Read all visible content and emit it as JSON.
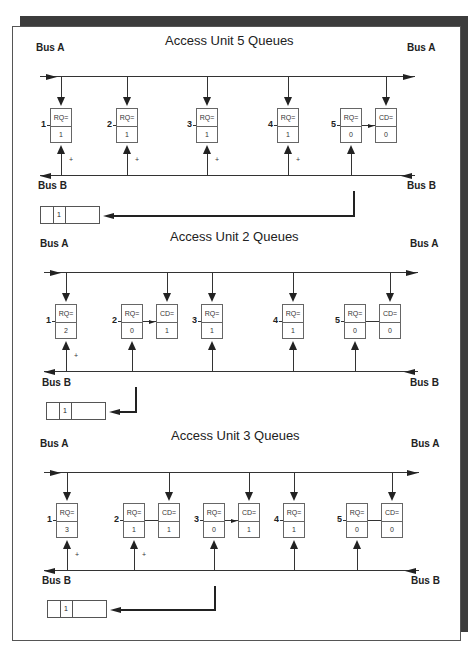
{
  "sections": [
    {
      "title": "Access Unit 5 Queues",
      "bus_a_label": "Bus A",
      "bus_b_label": "Bus B",
      "layout": {
        "title_x": 165,
        "title_y": 47,
        "bus_a_label_y": 52,
        "bus_a_y": 76,
        "box_y": 108,
        "bus_b_y": 175,
        "bus_b_label_y": 186,
        "queue_y": 206,
        "queue_x": 40,
        "bus_line_x1": 40,
        "bus_line_x2": 415
      },
      "units": [
        {
          "num": "1",
          "x": 50,
          "cells": [
            {
              "label": "RQ=",
              "value": "1",
              "bus_a_drop": true,
              "bus_b_rise": true,
              "plus": true
            }
          ]
        },
        {
          "num": "2",
          "x": 116,
          "cells": [
            {
              "label": "RQ=",
              "value": "1",
              "bus_a_drop": true,
              "bus_b_rise": true,
              "plus": true
            }
          ]
        },
        {
          "num": "3",
          "x": 196,
          "cells": [
            {
              "label": "RQ=",
              "value": "1",
              "bus_a_drop": true,
              "bus_b_rise": true,
              "plus": true
            }
          ]
        },
        {
          "num": "4",
          "x": 277,
          "cells": [
            {
              "label": "RQ=",
              "value": "1",
              "bus_a_drop": true,
              "bus_b_rise": true,
              "plus": true
            }
          ]
        },
        {
          "num": "5",
          "x": 340,
          "cells": [
            {
              "label": "RQ=",
              "value": "0",
              "bus_a_drop": false,
              "bus_b_rise": true,
              "plus": false
            },
            {
              "label": "CD=",
              "value": "0",
              "bus_a_drop": true,
              "bus_b_rise": false,
              "plus": false
            }
          ],
          "connector": "arrow"
        }
      ],
      "queue": {
        "value": "1"
      },
      "return_path": {
        "from_x": 353,
        "top_y": 191
      }
    },
    {
      "title": "Access Unit 2 Queues",
      "bus_a_label": "Bus A",
      "bus_b_label": "Bus B",
      "layout": {
        "title_x": 170,
        "title_y": 243,
        "bus_a_label_y": 248,
        "bus_a_y": 272,
        "box_y": 304,
        "bus_b_y": 371,
        "bus_b_label_y": 383,
        "queue_y": 402,
        "queue_x": 46,
        "bus_line_x1": 44,
        "bus_line_x2": 418
      },
      "units": [
        {
          "num": "1",
          "x": 55,
          "cells": [
            {
              "label": "RQ=",
              "value": "2",
              "bus_a_drop": true,
              "bus_b_rise": true,
              "plus": true
            }
          ]
        },
        {
          "num": "2",
          "x": 121,
          "cells": [
            {
              "label": "RQ=",
              "value": "0",
              "bus_a_drop": false,
              "bus_b_rise": true,
              "plus": false
            },
            {
              "label": "CD=",
              "value": "1",
              "bus_a_drop": true,
              "bus_b_rise": false,
              "plus": false
            }
          ],
          "connector": "arrow"
        },
        {
          "num": "3",
          "x": 201,
          "cells": [
            {
              "label": "RQ=",
              "value": "1",
              "bus_a_drop": true,
              "bus_b_rise": true,
              "plus": false
            }
          ]
        },
        {
          "num": "4",
          "x": 282,
          "cells": [
            {
              "label": "RQ=",
              "value": "1",
              "bus_a_drop": true,
              "bus_b_rise": true,
              "plus": false
            }
          ]
        },
        {
          "num": "5",
          "x": 344,
          "cells": [
            {
              "label": "RQ=",
              "value": "0",
              "bus_a_drop": false,
              "bus_b_rise": true,
              "plus": false
            },
            {
              "label": "CD=",
              "value": "0",
              "bus_a_drop": true,
              "bus_b_rise": false,
              "plus": false
            }
          ],
          "connector": "line"
        }
      ],
      "queue": {
        "value": "1"
      },
      "return_path": {
        "from_x": 135,
        "top_y": 387
      }
    },
    {
      "title": "Access Unit 3 Queues",
      "bus_a_label": "Bus A",
      "bus_b_label": "Bus B",
      "layout": {
        "title_x": 171,
        "title_y": 442,
        "bus_a_label_y": 448,
        "bus_a_y": 472,
        "box_y": 503,
        "bus_b_y": 570,
        "bus_b_label_y": 581,
        "queue_y": 600,
        "queue_x": 47,
        "bus_line_x1": 44,
        "bus_line_x2": 419
      },
      "units": [
        {
          "num": "1",
          "x": 56,
          "cells": [
            {
              "label": "RQ=",
              "value": "3",
              "bus_a_drop": true,
              "bus_b_rise": true,
              "plus": true
            }
          ]
        },
        {
          "num": "2",
          "x": 123,
          "cells": [
            {
              "label": "RQ=",
              "value": "1",
              "bus_a_drop": false,
              "bus_b_rise": true,
              "plus": true
            },
            {
              "label": "CD=",
              "value": "1",
              "bus_a_drop": true,
              "bus_b_rise": false,
              "plus": false
            }
          ],
          "connector": "line"
        },
        {
          "num": "3",
          "x": 203,
          "cells": [
            {
              "label": "RQ=",
              "value": "0",
              "bus_a_drop": false,
              "bus_b_rise": true,
              "plus": false
            },
            {
              "label": "CD=",
              "value": "1",
              "bus_a_drop": true,
              "bus_b_rise": false,
              "plus": false
            }
          ],
          "connector": "arrow"
        },
        {
          "num": "4",
          "x": 283,
          "cells": [
            {
              "label": "RQ=",
              "value": "1",
              "bus_a_drop": true,
              "bus_b_rise": true,
              "plus": false
            }
          ]
        },
        {
          "num": "5",
          "x": 346,
          "cells": [
            {
              "label": "RQ=",
              "value": "0",
              "bus_a_drop": false,
              "bus_b_rise": true,
              "plus": false
            },
            {
              "label": "CD=",
              "value": "0",
              "bus_a_drop": true,
              "bus_b_rise": false,
              "plus": false
            }
          ],
          "connector": "line"
        }
      ],
      "queue": {
        "value": "1"
      },
      "return_path": {
        "from_x": 214,
        "top_y": 586
      }
    }
  ]
}
